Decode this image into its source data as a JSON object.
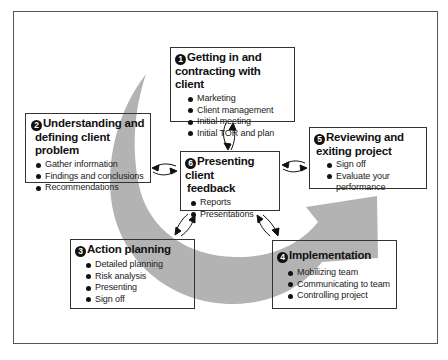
{
  "diagram": {
    "type": "consulting-process-cycle",
    "arrow_color": "#b3b3b3",
    "steps": [
      {
        "number": "1",
        "title_line1": "Getting in and",
        "title_line2": "contracting with client",
        "items": [
          "Marketing",
          "Client management",
          "Initial meeting",
          "Initial TOR and plan"
        ]
      },
      {
        "number": "2",
        "title_line1": "Understanding and",
        "title_line2": "defining client problem",
        "items": [
          "Gather information",
          "Findings and conclusions",
          "Recommendations"
        ]
      },
      {
        "number": "3",
        "title_line1": "Action planning",
        "items": [
          "Detailed planning",
          "Risk analysis",
          "Presenting",
          "Sign off"
        ]
      },
      {
        "number": "4",
        "title_line1": "Implementation",
        "items": [
          "Mobilizing team",
          "Communicating to team",
          "Controlling project"
        ]
      },
      {
        "number": "5",
        "title_line1": "Reviewing and",
        "title_line2": "exiting project",
        "items": [
          "Sign off",
          "Evaluate your",
          "performance"
        ]
      },
      {
        "number": "6",
        "title_line1": "Presenting client",
        "title_line2": "feedback",
        "items": [
          "Reports",
          "Presentations"
        ]
      }
    ],
    "connections": [
      {
        "from": "6",
        "to": "1",
        "type": "bidirectional"
      },
      {
        "from": "6",
        "to": "2",
        "type": "bidirectional"
      },
      {
        "from": "6",
        "to": "3",
        "type": "bidirectional"
      },
      {
        "from": "6",
        "to": "4",
        "type": "bidirectional"
      },
      {
        "from": "6",
        "to": "5",
        "type": "bidirectional"
      }
    ]
  }
}
